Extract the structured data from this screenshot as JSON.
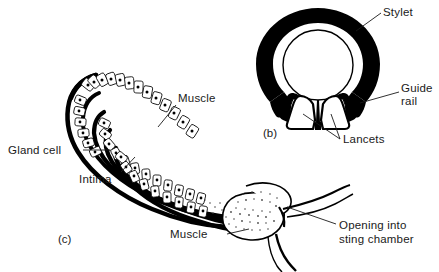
{
  "figure": {
    "background_color": "#ffffff",
    "ink_color": "#000000",
    "text_color": "#1a1a1a",
    "width": 439,
    "height": 272
  },
  "panels": [
    {
      "id": "panel-b",
      "caption": "(b)",
      "description": "Cross-section through the sting shaft showing the stylet ring, guide rails and paired lancets"
    },
    {
      "id": "panel-c",
      "caption": "(c)",
      "description": "Longitudinal section of the venom gland, duct and bulb opening into the sting chamber"
    }
  ],
  "labels": {
    "stylet": "Stylet",
    "guide_rail_line1": "Guide",
    "guide_rail_line2": "rail",
    "lancets": "Lancets",
    "muscle_upper": "Muscle",
    "muscle_lower": "Muscle",
    "gland_cell": "Gland cell",
    "intima": "Intima",
    "opening_line1": "Opening into",
    "opening_line2": "sting chamber"
  },
  "structures": {
    "stylet_ring": "stylet-ring",
    "inner_lumen": "stylet-lumen",
    "lancet_left": "lancet-left",
    "lancet_right": "lancet-right",
    "guide_rail_left": "guide-rail-left",
    "guide_rail_right": "guide-rail-right",
    "gland_tube": "gland-tube",
    "gland_epithelium": "gland-epithelium",
    "venom_bulb": "venom-bulb",
    "duct_tail_upper": "duct-tail-upper",
    "duct_tail_lower": "duct-tail-lower"
  }
}
